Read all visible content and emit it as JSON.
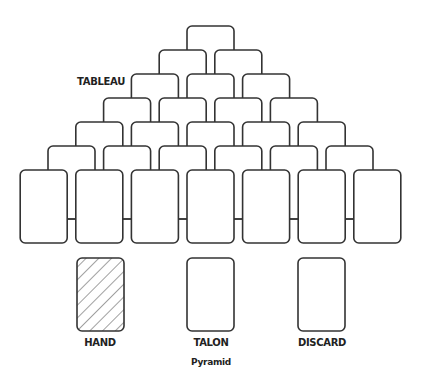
{
  "diagram": {
    "title": "Pyramid",
    "tableau_label": "TABLEAU",
    "piles": [
      {
        "label": "HAND",
        "face": "down"
      },
      {
        "label": "TALON",
        "face": "empty"
      },
      {
        "label": "DISCARD",
        "face": "empty"
      }
    ],
    "pyramid_rows": 7,
    "cards_per_row": [
      1,
      2,
      3,
      4,
      5,
      6,
      7
    ],
    "stroke_color": "#333333",
    "background": "#ffffff"
  }
}
